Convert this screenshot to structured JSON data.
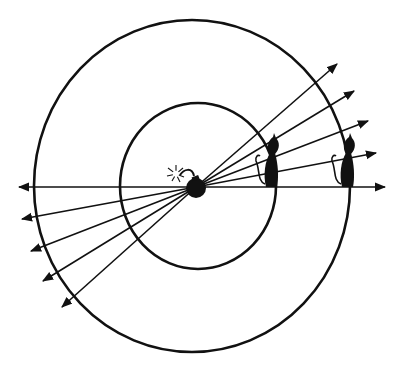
{
  "diagram": {
    "title": "",
    "colors": {
      "ink": "#111111",
      "background": "#ffffff"
    },
    "center": {
      "x": 196,
      "y": 187
    },
    "rings": [
      {
        "name": "outer-ring",
        "cx": 192,
        "cy": 186,
        "rx": 158,
        "ry": 166
      },
      {
        "name": "inner-ring",
        "cx": 198,
        "cy": 186,
        "rx": 78,
        "ry": 83
      }
    ],
    "bomb": {
      "x": 196,
      "y": 187,
      "icon": "bomb-icon"
    },
    "cats": [
      {
        "name": "cat-inner",
        "x": 272,
        "y": 187,
        "icon": "cat-icon"
      },
      {
        "name": "cat-outer",
        "x": 348,
        "y": 187,
        "icon": "cat-icon"
      }
    ],
    "rays": [
      {
        "from": [
          196,
          187
        ],
        "to": [
          385,
          187
        ]
      },
      {
        "from": [
          196,
          187
        ],
        "to": [
          19,
          187
        ]
      },
      {
        "from": [
          196,
          187
        ],
        "to": [
          337,
          64
        ]
      },
      {
        "from": [
          196,
          187
        ],
        "to": [
          354,
          91
        ]
      },
      {
        "from": [
          196,
          187
        ],
        "to": [
          368,
          121
        ]
      },
      {
        "from": [
          196,
          187
        ],
        "to": [
          376,
          153
        ]
      },
      {
        "from": [
          196,
          187
        ],
        "to": [
          22,
          219
        ]
      },
      {
        "from": [
          196,
          187
        ],
        "to": [
          31,
          251
        ]
      },
      {
        "from": [
          196,
          187
        ],
        "to": [
          43,
          281
        ]
      },
      {
        "from": [
          196,
          187
        ],
        "to": [
          62,
          307
        ]
      }
    ]
  }
}
